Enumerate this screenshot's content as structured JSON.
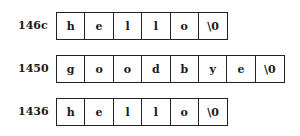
{
  "strings": [
    {
      "address": "146c",
      "chars": [
        "h",
        "e",
        "l",
        "l",
        "o",
        "\\0"
      ]
    },
    {
      "address": "1450",
      "chars": [
        "g",
        "o",
        "o",
        "d",
        "b",
        "y",
        "e",
        "\\0"
      ]
    },
    {
      "address": "1436",
      "chars": [
        "h",
        "e",
        "l",
        "l",
        "o",
        "\\0"
      ]
    }
  ]
}
